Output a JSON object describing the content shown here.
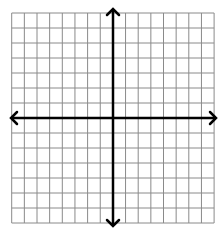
{
  "diagram": {
    "type": "coordinate-plane",
    "grid": {
      "columns": 16,
      "rows": 14,
      "columns_left_of_y_axis": 8,
      "columns_right_of_y_axis": 8,
      "rows_above_x_axis": 7,
      "rows_below_x_axis": 7,
      "bounds": {
        "left": 11.7,
        "right": 214.1,
        "top": 13,
        "bottom": 223
      },
      "line_color": "#8a8a8a",
      "line_width": 1
    },
    "axes": {
      "color": "#000000",
      "stroke_width": 2.5,
      "x_axis": {
        "y": 118,
        "x_start": 11,
        "x_end": 216,
        "arrows": [
          "left",
          "right"
        ]
      },
      "y_axis": {
        "x": 113,
        "y_start": 9,
        "y_end": 226,
        "arrows": [
          "up",
          "down"
        ]
      },
      "arrowhead_size": 6
    },
    "labels": []
  },
  "colors": {
    "background": "#ffffff",
    "grid": "#8a8a8a",
    "axis": "#000000"
  }
}
